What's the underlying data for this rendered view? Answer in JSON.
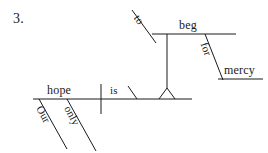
{
  "page": {
    "item_number": "3.",
    "background_color": "#ffffff",
    "ink_color": "#1a1a1a",
    "width": 268,
    "height": 153
  },
  "diagram": {
    "type": "reed-kellogg-sentence-diagram",
    "sentence": "Our only hope is to beg for mercy",
    "main_clause": {
      "subject": "hope",
      "verb": "is",
      "subject_modifiers": [
        "Our",
        "only"
      ]
    },
    "infinitive_phrase": {
      "marker": "to",
      "verb": "beg",
      "preposition": "for",
      "object_of_preposition": "mercy"
    },
    "words": {
      "hope": "hope",
      "is": "is",
      "our": "Our",
      "only": "only",
      "to": "to",
      "beg": "beg",
      "for": "for",
      "mercy": "mercy"
    }
  }
}
